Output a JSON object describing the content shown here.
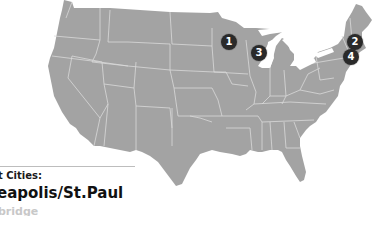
{
  "map": {
    "land_color": "#a3a3a3",
    "border_color": "#d9d9d9",
    "background": "#ffffff"
  },
  "markers": [
    {
      "label": "1",
      "x": 229,
      "y": 42
    },
    {
      "label": "2",
      "x": 355,
      "y": 42
    },
    {
      "label": "3",
      "x": 259,
      "y": 52
    },
    {
      "label": "4",
      "x": 351,
      "y": 57
    }
  ],
  "legend": {
    "title": "t Cities:",
    "city": "eapolis/St.Paul",
    "next": "bridge"
  }
}
